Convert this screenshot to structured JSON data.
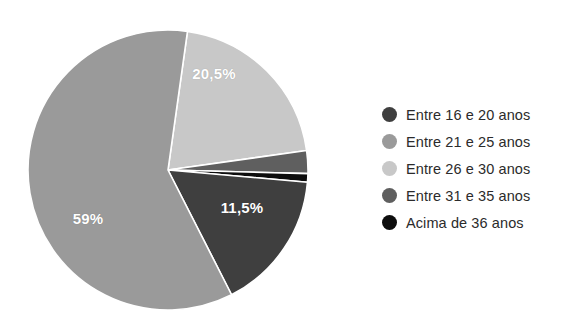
{
  "chart_data": {
    "type": "pie",
    "title": "",
    "subtitle": "",
    "xlabel": "",
    "ylabel": "",
    "grid": false,
    "legend_position": "right",
    "center": {
      "x": 168,
      "y": 170
    },
    "radius": 140,
    "start_angle_deg": -82,
    "direction": "clockwise",
    "categories": [
      "Entre 16 e 20 anos",
      "Entre 21 e 25 anos",
      "Entre 26 e 30 anos",
      "Entre 31 e 35 anos",
      "Acima de 36 anos"
    ],
    "values": [
      11.5,
      59,
      20.5,
      8.0,
      1.0
    ],
    "value_unit": "%",
    "colors": [
      "#3f3f3f",
      "#9a9a9a",
      "#c8c8c8",
      "#5f5f5f",
      "#0d0d0d"
    ],
    "slices": [
      {
        "label": "Entre 26 e 30 anos",
        "value": 20.5,
        "display": "20,5%",
        "color": "#c8c8c8",
        "start_deg": -82,
        "end_deg": -8,
        "label_x": 214,
        "label_y": 73,
        "label_visible": true
      },
      {
        "label": "Entre 31 e 35 anos",
        "value": 8.0,
        "display": "",
        "color": "#5f5f5f",
        "start_deg": -8,
        "end_deg": 1.5,
        "label_x": 250,
        "label_y": 140,
        "label_visible": false
      },
      {
        "label": "Acima de 36 anos",
        "value": 1.0,
        "display": "",
        "color": "#0d0d0d",
        "start_deg": 1.5,
        "end_deg": 5,
        "label_x": 255,
        "label_y": 170,
        "label_visible": false
      },
      {
        "label": "Entre 16 e 20 anos",
        "value": 11.5,
        "display": "11,5%",
        "color": "#3f3f3f",
        "start_deg": 5,
        "end_deg": 63,
        "label_x": 242,
        "label_y": 207,
        "label_visible": true
      },
      {
        "label": "Entre 21 e 25 anos",
        "value": 59,
        "display": "59%",
        "color": "#9a9a9a",
        "start_deg": 63,
        "end_deg": 278,
        "label_x": 88,
        "label_y": 218,
        "label_visible": true
      }
    ],
    "slice_border_color": "#ffffff",
    "slice_border_width": 1.6,
    "label_text_color": "#ffffff"
  },
  "legend": {
    "items": [
      {
        "label": "Entre 16 e 20 anos",
        "color": "#3f3f3f"
      },
      {
        "label": "Entre 21 e 25 anos",
        "color": "#9a9a9a"
      },
      {
        "label": "Entre 26 e 30 anos",
        "color": "#c8c8c8"
      },
      {
        "label": "Entre 31 e 35 anos",
        "color": "#5f5f5f"
      },
      {
        "label": "Acima de 36 anos",
        "color": "#0d0d0d"
      }
    ]
  },
  "background_color": "#ffffff"
}
